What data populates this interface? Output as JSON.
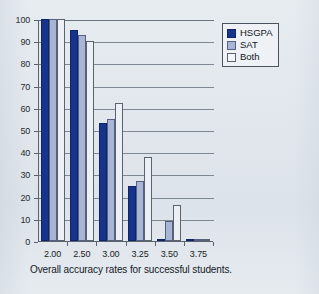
{
  "caption": "Overall accuracy rates for successful students.",
  "legend": {
    "position": "top-right",
    "entries": [
      {
        "label": "HSGPA",
        "color": "#17348c",
        "icon": "legend-swatch-icon"
      },
      {
        "label": "SAT",
        "color": "#a8b5d4",
        "icon": "legend-swatch-icon"
      },
      {
        "label": "Both",
        "color": "#f4f6f9",
        "icon": "legend-swatch-icon"
      }
    ]
  },
  "axes": {
    "y_ticks": [
      "0",
      "10",
      "20",
      "30",
      "40",
      "50",
      "60",
      "70",
      "80",
      "90",
      "100"
    ],
    "x_ticks": [
      "2.00",
      "2.50",
      "3.00",
      "3.25",
      "3.50",
      "3.75"
    ]
  },
  "chart_data": {
    "type": "bar",
    "title": "",
    "subtitle": "",
    "xlabel": "",
    "ylabel": "",
    "ylim": [
      0,
      100
    ],
    "ytick_step": 10,
    "grid": true,
    "legend_position": "top-right",
    "categories": [
      "2.00",
      "2.50",
      "3.00",
      "3.25",
      "3.50",
      "3.75"
    ],
    "series": [
      {
        "name": "HSGPA",
        "color": "#17348c",
        "values": [
          100,
          95,
          53,
          25,
          0.5,
          1
        ]
      },
      {
        "name": "SAT",
        "color": "#a8b5d4",
        "values": [
          100,
          93,
          55,
          27,
          9,
          1
        ]
      },
      {
        "name": "Both",
        "color": "#eceff4",
        "values": [
          100,
          90,
          62,
          38,
          16,
          1
        ]
      }
    ],
    "annotations": [
      "Overall accuracy rates for successful students."
    ]
  }
}
